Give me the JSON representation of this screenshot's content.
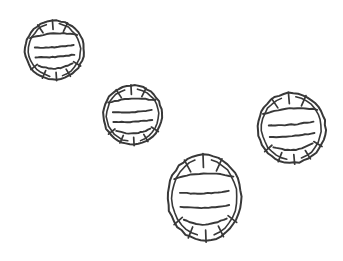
{
  "image": {
    "title": "Hand-drawn sketch of four striped spheres",
    "width": 343,
    "height": 261,
    "background_color": "#ffffff",
    "stroke_color": "#383838",
    "style": "pencil-sketch-line-drawing",
    "object_count": 4,
    "object_name": "striped-ball"
  },
  "objects": [
    {
      "id": "ball-1",
      "label": "striped ball top-left",
      "cx": 54.5,
      "cy": 50.0,
      "rx": 29.5,
      "ry": 29.5,
      "rotation": -4,
      "top_ticks": 3,
      "bottom_ticks": 5,
      "mid_lines": 2
    },
    {
      "id": "ball-2",
      "label": "striped ball upper-middle",
      "cx": 132.5,
      "cy": 115.0,
      "rx": 29.5,
      "ry": 29.5,
      "rotation": -3,
      "top_ticks": 3,
      "bottom_ticks": 5,
      "mid_lines": 2
    },
    {
      "id": "ball-3",
      "label": "striped ball right",
      "cx": 291.5,
      "cy": 128.0,
      "rx": 34.0,
      "ry": 35.0,
      "rotation": -5,
      "top_ticks": 3,
      "bottom_ticks": 5,
      "mid_lines": 2
    },
    {
      "id": "ball-4",
      "label": "striped ball bottom-center",
      "cx": 204.5,
      "cy": 197.5,
      "rx": 37.0,
      "ry": 43.0,
      "rotation": -2,
      "top_ticks": 3,
      "bottom_ticks": 5,
      "mid_lines": 2
    }
  ],
  "caption": ""
}
